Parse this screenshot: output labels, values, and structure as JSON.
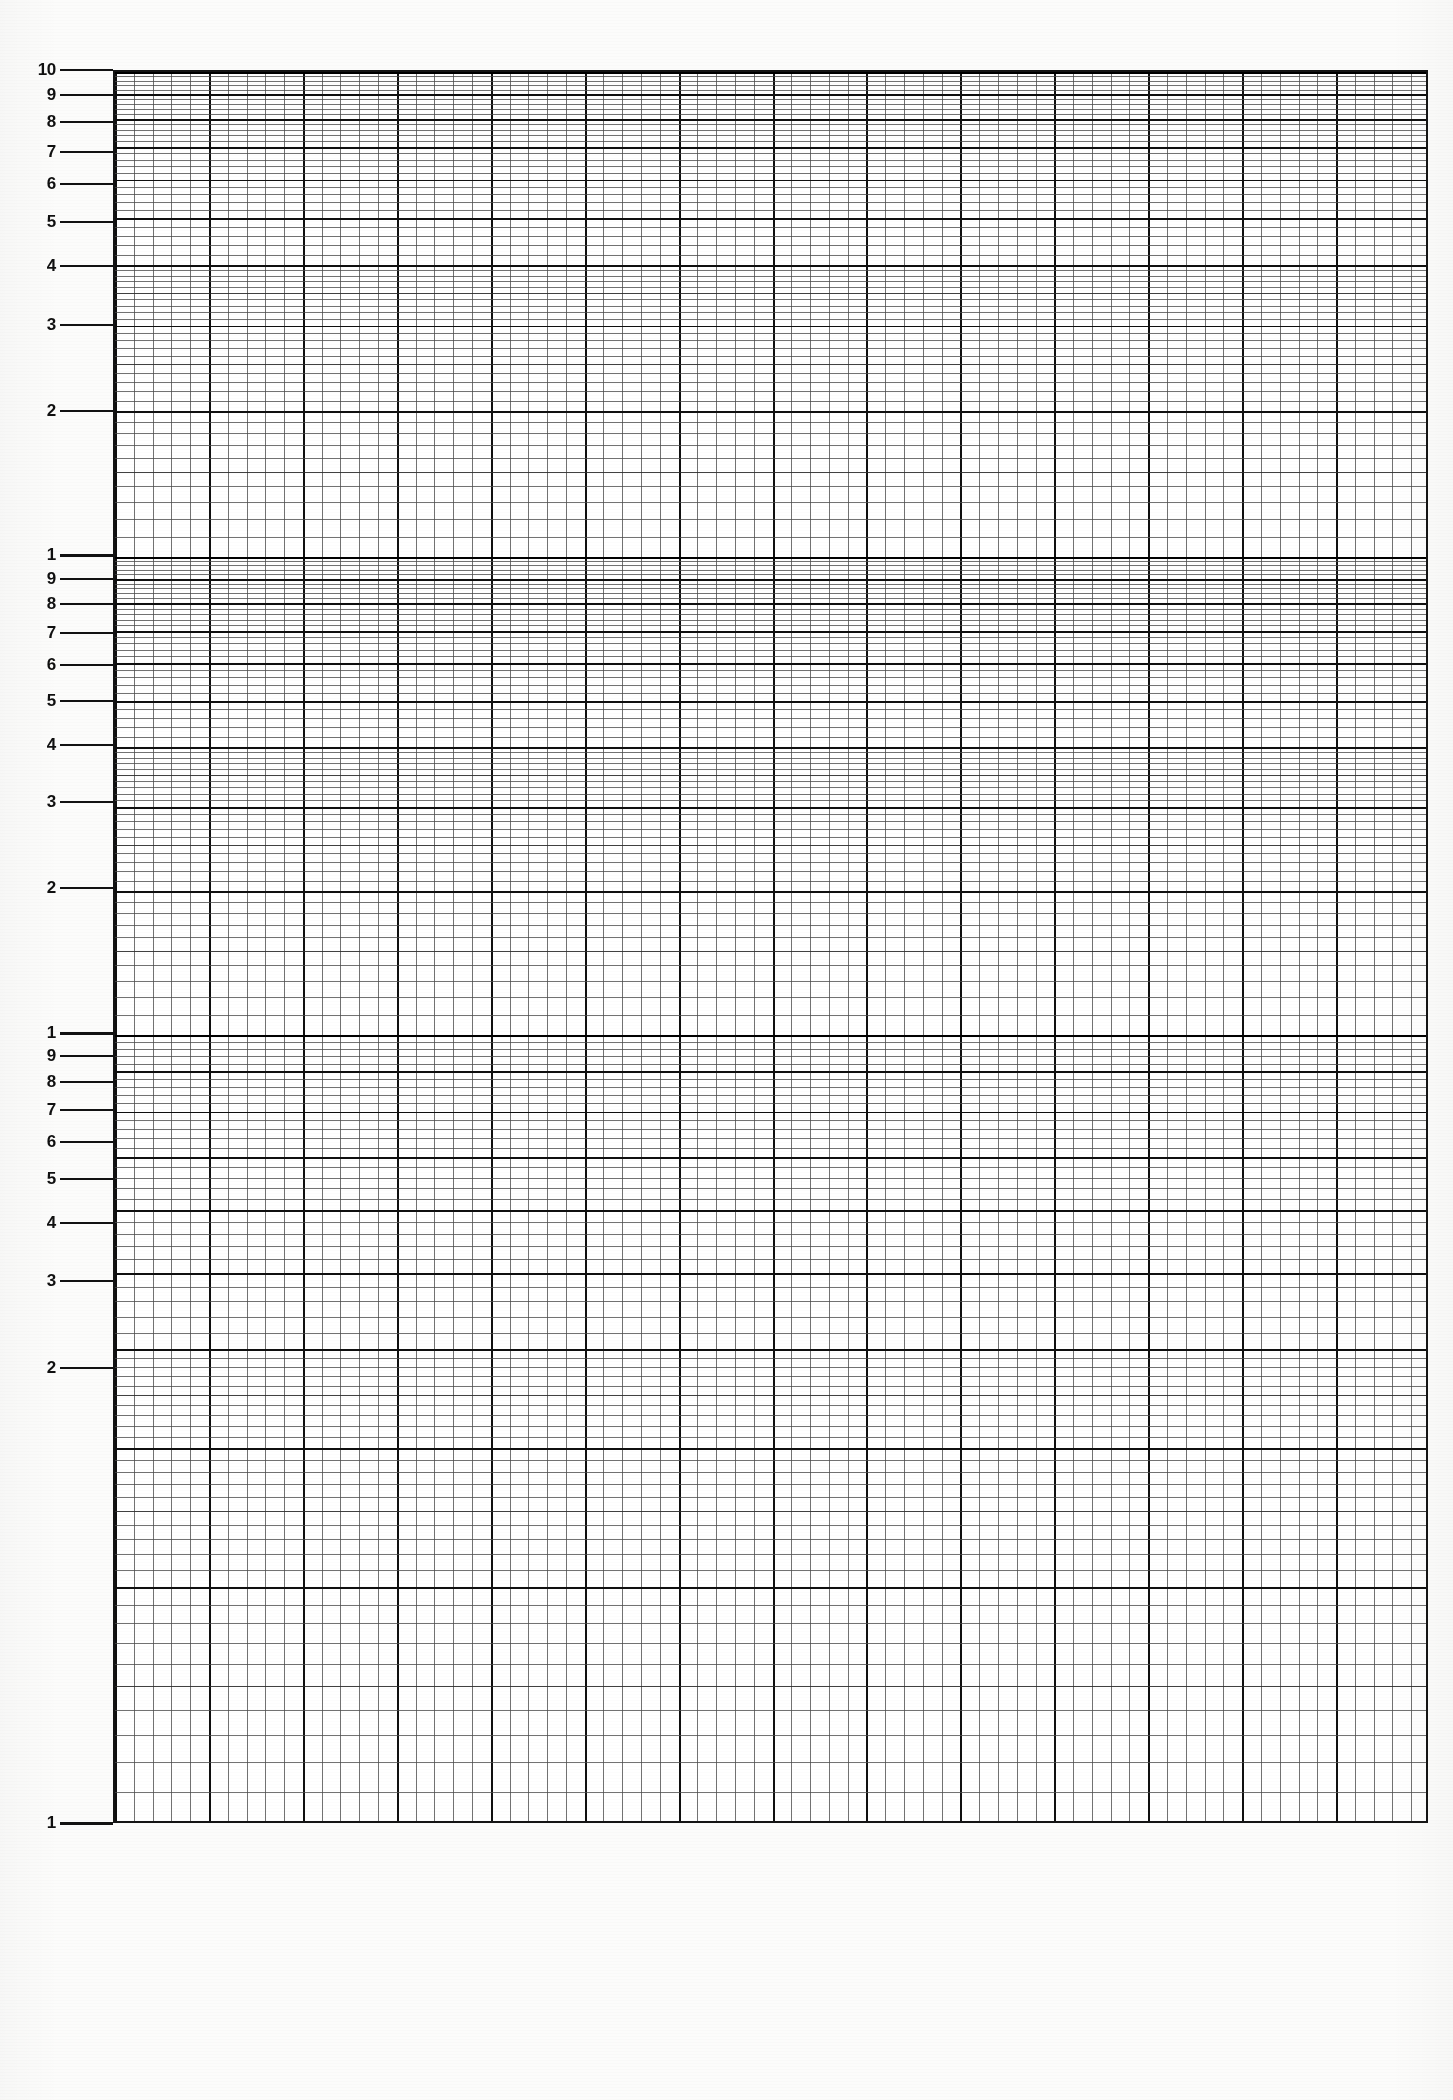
{
  "document": {
    "title": "Three Cycle Semi-Logarithmic Graph Paper",
    "kind": "log-grid-sheet",
    "page_width": 1453,
    "page_height": 2100,
    "background_color": "#fcfcfb",
    "ink_color": "#111111"
  },
  "plot": {
    "left": 113,
    "right": 1428,
    "top": 70,
    "bottom": 1823,
    "border_color": "#141414",
    "fill_color": "#ffffff"
  },
  "x_axis": {
    "type": "linear",
    "minor_divisions": 70,
    "major_every": 5,
    "tick_labels": [],
    "label": ""
  },
  "y_axis": {
    "type": "logarithmic",
    "cycles": 3,
    "cycle_boundaries_px": [
      70,
      555,
      1033,
      1823
    ],
    "label": "",
    "decade_labels": [
      "1",
      "2",
      "3",
      "4",
      "5",
      "6",
      "7",
      "8",
      "9",
      "10"
    ]
  },
  "chart_data": {
    "type": "table",
    "title": "",
    "subtitle": "",
    "xlabel": "",
    "ylabel": "",
    "grid": true,
    "legend": null,
    "series": [],
    "y_tick_values": [
      1,
      2,
      3,
      4,
      5,
      6,
      7,
      8,
      9,
      10,
      20,
      30,
      40,
      50,
      60,
      70,
      80,
      90,
      100,
      200,
      300,
      400,
      500,
      600,
      700,
      800,
      900,
      1000
    ],
    "x_range": [
      0,
      70
    ],
    "y_range": [
      1,
      1000
    ]
  },
  "axis_ticks": [
    {
      "label": "10",
      "y": 70,
      "cycle": 1,
      "weight": "major"
    },
    {
      "label": "9",
      "y": 95,
      "cycle": 1,
      "weight": "major"
    },
    {
      "label": "8",
      "y": 122,
      "cycle": 1,
      "weight": "major"
    },
    {
      "label": "7",
      "y": 152,
      "cycle": 1,
      "weight": "major"
    },
    {
      "label": "6",
      "y": 184,
      "cycle": 1,
      "weight": "major"
    },
    {
      "label": "5",
      "y": 222,
      "cycle": 1,
      "weight": "major"
    },
    {
      "label": "4",
      "y": 266,
      "cycle": 1,
      "weight": "major"
    },
    {
      "label": "3",
      "y": 325,
      "cycle": 1,
      "weight": "major"
    },
    {
      "label": "2",
      "y": 411,
      "cycle": 1,
      "weight": "major"
    },
    {
      "label": "1",
      "y": 555,
      "cycle": 1,
      "weight": "heavy"
    },
    {
      "label": "9",
      "y": 579,
      "cycle": 2,
      "weight": "major"
    },
    {
      "label": "8",
      "y": 604,
      "cycle": 2,
      "weight": "major"
    },
    {
      "label": "7",
      "y": 633,
      "cycle": 2,
      "weight": "major"
    },
    {
      "label": "6",
      "y": 665,
      "cycle": 2,
      "weight": "major"
    },
    {
      "label": "5",
      "y": 701,
      "cycle": 2,
      "weight": "major"
    },
    {
      "label": "4",
      "y": 745,
      "cycle": 2,
      "weight": "major"
    },
    {
      "label": "3",
      "y": 802,
      "cycle": 2,
      "weight": "major"
    },
    {
      "label": "2",
      "y": 888,
      "cycle": 2,
      "weight": "major"
    },
    {
      "label": "1",
      "y": 1033,
      "cycle": 2,
      "weight": "heavy"
    },
    {
      "label": "9",
      "y": 1056,
      "cycle": 3,
      "weight": "major"
    },
    {
      "label": "8",
      "y": 1082,
      "cycle": 3,
      "weight": "major"
    },
    {
      "label": "7",
      "y": 1110,
      "cycle": 3,
      "weight": "major"
    },
    {
      "label": "6",
      "y": 1142,
      "cycle": 3,
      "weight": "major"
    },
    {
      "label": "5",
      "y": 1179,
      "cycle": 3,
      "weight": "major"
    },
    {
      "label": "4",
      "y": 1223,
      "cycle": 3,
      "weight": "major"
    },
    {
      "label": "3",
      "y": 1281,
      "cycle": 3,
      "weight": "major"
    },
    {
      "label": "2",
      "y": 1368,
      "cycle": 3,
      "weight": "major"
    },
    {
      "label": "1",
      "y": 1823,
      "cycle": 3,
      "weight": "heavy"
    }
  ]
}
